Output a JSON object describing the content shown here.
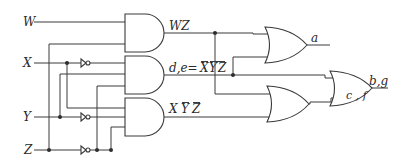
{
  "diagram": {
    "type": "logic-circuit",
    "inputs": [
      {
        "name": "W",
        "label": "W"
      },
      {
        "name": "X",
        "label": "X"
      },
      {
        "name": "Y",
        "label": "Y"
      },
      {
        "name": "Z",
        "label": "Z"
      }
    ],
    "and_gates": [
      {
        "id": "and1",
        "output_label": "WZ",
        "inputs": [
          "W",
          "Z"
        ]
      },
      {
        "id": "and2",
        "output_label_prefix": "d,e=",
        "output_label_expr": "XYZ",
        "overbar": "all",
        "inputs": [
          "X'",
          "Y",
          "Z'"
        ]
      },
      {
        "id": "and3",
        "output_label_expr": "X Y Z",
        "overbar": "Y,Z",
        "inputs": [
          "X",
          "Y'",
          "Z'"
        ]
      }
    ],
    "or_gates": [
      {
        "id": "or_a",
        "output_label": "a",
        "inputs": [
          "WZ",
          "d,e"
        ]
      },
      {
        "id": "or_cf",
        "output_label": "c , f",
        "inputs": [
          "WZ",
          "XȲZ̄"
        ]
      },
      {
        "id": "or_bg",
        "output_label": "b,g",
        "inputs": [
          "d,e",
          "c,f"
        ]
      }
    ],
    "labels": {
      "W": "W",
      "X": "X",
      "Y": "Y",
      "Z": "Z",
      "wz": "WZ",
      "de_prefix": "d,e=",
      "de_x": "X",
      "de_y": "Y",
      "de_z": "Z",
      "and3_x": "X",
      "and3_y": "Y",
      "and3_z": "Z",
      "a": "a",
      "cf": "c , f",
      "bg": "b,g"
    }
  }
}
